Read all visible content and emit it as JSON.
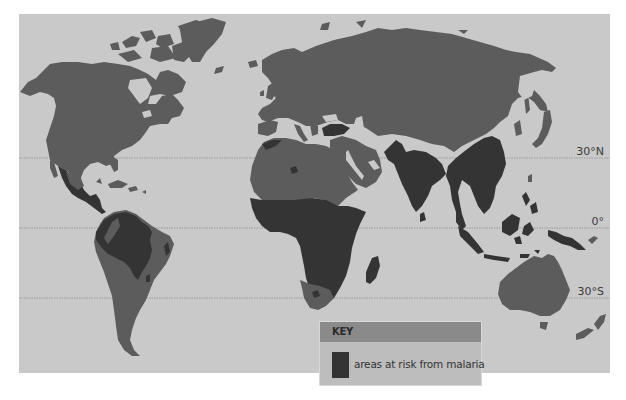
{
  "map": {
    "title": "Malaria risk world map",
    "colors": {
      "page_background": "#ffffff",
      "ocean": "#c9c9c9",
      "land": "#5c5c5c",
      "malaria_risk": "#343434",
      "gridline": "#8f8f8f",
      "key_header": "#8a8a8a",
      "key_body": "#bdbdbd"
    },
    "latitude_lines": [
      {
        "label": "30°N",
        "y": 158
      },
      {
        "label": "0°",
        "y": 228
      },
      {
        "label": "30°S",
        "y": 298
      }
    ],
    "risk_regions": [
      "Mexico and Central America",
      "Northern South America / Amazon basin",
      "Sub-Saharan Africa",
      "Turkey",
      "South Asia (India, Pakistan)",
      "Southeast Asia and Southern China",
      "Indonesia / Malaysia / Philippines",
      "Papua New Guinea",
      "Madagascar"
    ]
  },
  "key": {
    "title": "KEY",
    "items": [
      {
        "label": "areas at risk from malaria",
        "color": "#343434"
      }
    ]
  }
}
